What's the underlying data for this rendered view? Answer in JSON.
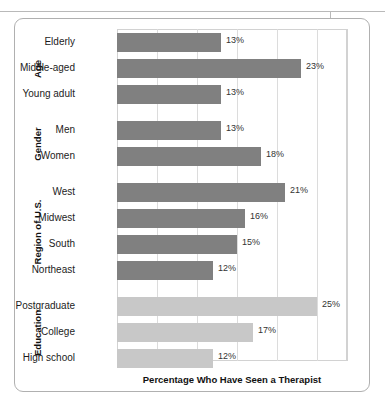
{
  "figure": {
    "axis_title": "Percentage Who Have Seen a Therapist"
  },
  "groups": [
    {
      "name": "Age"
    },
    {
      "name": "Gender"
    },
    {
      "name": "Region of U.S."
    },
    {
      "name": "Education"
    }
  ],
  "colors": {
    "bar_dark": "#808080",
    "bar_light": "#c8c8c8",
    "gridline": "#dcdcdc",
    "plot_border": "#d2d2d2",
    "frame_border": "#b0b0b0",
    "text": "#1c1c1c"
  },
  "bars": [
    {
      "label": "Elderly",
      "value": 13,
      "value_label": "13%",
      "group": "Age",
      "shade": "dark"
    },
    {
      "label": "Middle-aged",
      "value": 23,
      "value_label": "23%",
      "group": "Age",
      "shade": "dark"
    },
    {
      "label": "Young adult",
      "value": 13,
      "value_label": "13%",
      "group": "Age",
      "shade": "dark"
    },
    {
      "label": "Men",
      "value": 13,
      "value_label": "13%",
      "group": "Gender",
      "shade": "dark"
    },
    {
      "label": "Women",
      "value": 18,
      "value_label": "18%",
      "group": "Gender",
      "shade": "dark"
    },
    {
      "label": "West",
      "value": 21,
      "value_label": "21%",
      "group": "Region of U.S.",
      "shade": "dark"
    },
    {
      "label": "Midwest",
      "value": 16,
      "value_label": "16%",
      "group": "Region of U.S.",
      "shade": "dark"
    },
    {
      "label": "South",
      "value": 15,
      "value_label": "15%",
      "group": "Region of U.S.",
      "shade": "dark"
    },
    {
      "label": "Northeast",
      "value": 12,
      "value_label": "12%",
      "group": "Region of U.S.",
      "shade": "dark"
    },
    {
      "label": "Postgraduate",
      "value": 25,
      "value_label": "25%",
      "group": "Education",
      "shade": "light"
    },
    {
      "label": "College",
      "value": 17,
      "value_label": "17%",
      "group": "Education",
      "shade": "light"
    },
    {
      "label": "High school",
      "value": 12,
      "value_label": "12%",
      "group": "Education",
      "shade": "light"
    }
  ],
  "chart_data": {
    "type": "bar",
    "orientation": "horizontal",
    "title": "",
    "subtitle": "",
    "xlabel": "Percentage Who Have Seen a Therapist",
    "ylabel": "",
    "xlim": [
      0,
      28.75
    ],
    "grid": true,
    "grid_axis": "x",
    "gridline_values": [
      0,
      5,
      10,
      15,
      20,
      25
    ],
    "legend": "none",
    "categories": [
      "Elderly",
      "Middle-aged",
      "Young adult",
      "Men",
      "Women",
      "West",
      "Midwest",
      "South",
      "Northeast",
      "Postgraduate",
      "College",
      "High school"
    ],
    "values": [
      13,
      23,
      13,
      13,
      18,
      21,
      16,
      15,
      12,
      25,
      17,
      12
    ],
    "data_labels": [
      "13%",
      "23%",
      "13%",
      "13%",
      "18%",
      "21%",
      "16%",
      "15%",
      "12%",
      "25%",
      "17%",
      "12%"
    ],
    "group_labels": [
      "Age",
      "Gender",
      "Region of U.S.",
      "Education"
    ],
    "groups": [
      {
        "name": "Age",
        "categories": [
          "Elderly",
          "Middle-aged",
          "Young adult"
        ],
        "values": [
          13,
          23,
          13
        ]
      },
      {
        "name": "Gender",
        "categories": [
          "Men",
          "Women"
        ],
        "values": [
          13,
          18
        ]
      },
      {
        "name": "Region of U.S.",
        "categories": [
          "West",
          "Midwest",
          "South",
          "Northeast"
        ],
        "values": [
          21,
          16,
          15,
          12
        ]
      },
      {
        "name": "Education",
        "categories": [
          "Postgraduate",
          "College",
          "High school"
        ],
        "values": [
          25,
          17,
          12
        ]
      }
    ],
    "series_colors": {
      "dark": "#808080",
      "light": "#c8c8c8"
    },
    "units": "percent"
  }
}
